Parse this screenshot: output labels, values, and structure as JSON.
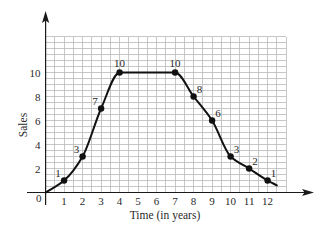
{
  "chart_data": {
    "type": "line",
    "title": "",
    "xlabel": "Time (in years)",
    "ylabel": "Sales",
    "xlim": [
      0,
      13
    ],
    "ylim": [
      0,
      13
    ],
    "grid": true,
    "grid_step": {
      "x": 0.5,
      "y": 0.5
    },
    "legend": null,
    "origin_label": "0",
    "x_ticks": [
      {
        "value": 1,
        "label": "1"
      },
      {
        "value": 2,
        "label": "2"
      },
      {
        "value": 3,
        "label": "3"
      },
      {
        "value": 4,
        "label": "4"
      },
      {
        "value": 5,
        "label": "5"
      },
      {
        "value": 6,
        "label": "6"
      },
      {
        "value": 7,
        "label": "7"
      },
      {
        "value": 8,
        "label": "8"
      },
      {
        "value": 9,
        "label": "9"
      },
      {
        "value": 10,
        "label": "10"
      },
      {
        "value": 11,
        "label": "11"
      },
      {
        "value": 12,
        "label": "12"
      }
    ],
    "y_ticks": [
      {
        "value": 2,
        "label": "2"
      },
      {
        "value": 4,
        "label": "4"
      },
      {
        "value": 6,
        "label": "6"
      },
      {
        "value": 8,
        "label": "8"
      },
      {
        "value": 10,
        "label": "10"
      }
    ],
    "curve_start": {
      "x": 0,
      "y": 0
    },
    "curve_end": {
      "x": 12.5,
      "y": 0.6
    },
    "points": [
      {
        "x": 1,
        "y": 1,
        "label": "1",
        "label_position": "upper-left"
      },
      {
        "x": 2,
        "y": 3,
        "label": "3",
        "label_position": "upper-left"
      },
      {
        "x": 3,
        "y": 7,
        "label": "7",
        "label_position": "upper-left"
      },
      {
        "x": 4,
        "y": 10,
        "label": "10",
        "label_position": "top"
      },
      {
        "x": 7,
        "y": 10,
        "label": "10",
        "label_position": "top"
      },
      {
        "x": 8,
        "y": 8,
        "label": "8",
        "label_position": "upper-right"
      },
      {
        "x": 9,
        "y": 6,
        "label": "6",
        "label_position": "upper-right"
      },
      {
        "x": 10,
        "y": 3,
        "label": "3",
        "label_position": "upper-right"
      },
      {
        "x": 11,
        "y": 2,
        "label": "2",
        "label_position": "upper-right"
      },
      {
        "x": 12,
        "y": 1,
        "label": "1",
        "label_position": "upper-right"
      }
    ],
    "x": [
      0,
      1,
      2,
      3,
      4,
      5,
      6,
      7,
      8,
      9,
      10,
      11,
      12
    ],
    "values": [
      0,
      1,
      3,
      7,
      10,
      10,
      10,
      10,
      8,
      6,
      3,
      2,
      1
    ]
  }
}
